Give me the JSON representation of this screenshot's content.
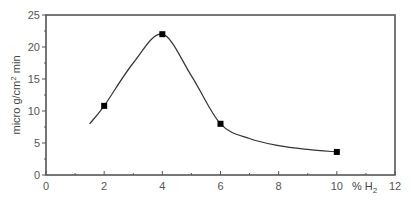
{
  "chart_data": {
    "type": "line",
    "title": "",
    "xlabel": "% H2",
    "xlabel_main": "% H",
    "xlabel_sub": "2",
    "ylabel": "micro g/cm2 min",
    "ylabel_parts": {
      "pre": "micro g/cm",
      "sup": "2",
      "post": " min"
    },
    "xlim": [
      0,
      12
    ],
    "ylim": [
      0,
      25
    ],
    "x_ticks": [
      0,
      2,
      4,
      6,
      8,
      10,
      12
    ],
    "x_tick_labels": [
      "0",
      "2",
      "4",
      "6",
      "8",
      "10",
      "12"
    ],
    "x_minor_ticks": [
      1,
      3,
      5,
      7,
      9,
      11
    ],
    "y_ticks": [
      0,
      5,
      10,
      15,
      20,
      25
    ],
    "y_tick_labels": [
      "0",
      "5",
      "10",
      "15",
      "20",
      "25"
    ],
    "y_minor_ticks": [
      2.5,
      7.5,
      12.5,
      17.5,
      22.5
    ],
    "grid": false,
    "legend": null,
    "series": [
      {
        "name": "measured",
        "marker": "square",
        "x": [
          2,
          4,
          6,
          10
        ],
        "y": [
          10.8,
          22,
          8,
          3.6
        ]
      }
    ],
    "fitted_curve": {
      "x": [
        1.5,
        2,
        3,
        4,
        5,
        6,
        7,
        8,
        9,
        10
      ],
      "y": [
        8,
        10.8,
        17.5,
        22,
        15.5,
        8,
        5.7,
        4.6,
        4.0,
        3.6
      ]
    }
  }
}
